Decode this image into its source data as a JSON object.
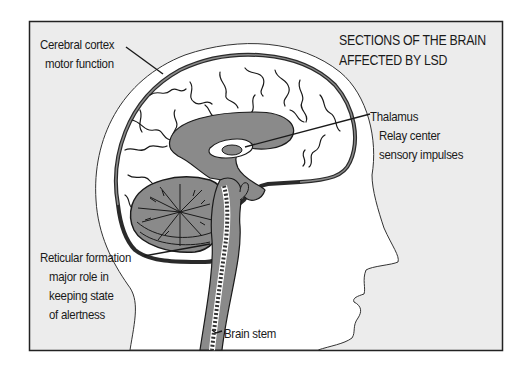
{
  "diagram": {
    "title_line1": "SECTIONS OF THE BRAIN",
    "title_line2": "AFFECTED BY  LSD",
    "colors": {
      "frame_bg": "#ececec",
      "head_fill": "#ffffff",
      "brain_gray": "#8a8a8a",
      "line": "#1a1a1a"
    },
    "labels": {
      "cerebral_cortex": {
        "name": "Cerebral cortex",
        "description": "motor function"
      },
      "thalamus": {
        "name": "Thalamus",
        "description_line1": "Relay center",
        "description_line2": "sensory impulses"
      },
      "reticular_formation": {
        "name": "Reticular formation",
        "description_line1": "major role in",
        "description_line2": "keeping state",
        "description_line3": "of alertness"
      },
      "brain_stem": {
        "name": "Brain stem"
      }
    }
  }
}
